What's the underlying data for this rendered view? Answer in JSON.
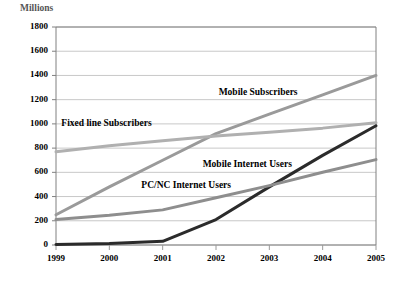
{
  "chart_data": {
    "type": "line",
    "title": "",
    "xlabel": "",
    "ylabel": "Millions",
    "unit_label": "Millions",
    "x": [
      "1999",
      "2000",
      "2001",
      "2002",
      "2003",
      "2004",
      "2005"
    ],
    "categories": [
      "1999",
      "2000",
      "2001",
      "2002",
      "2003",
      "2004",
      "2005"
    ],
    "xlim": [
      1999,
      2005
    ],
    "ylim": [
      0,
      1800
    ],
    "ytick_labels": [
      "0",
      "200",
      "400",
      "600",
      "800",
      "1000",
      "1200",
      "1400",
      "1600",
      "1800"
    ],
    "ytick_values": [
      0,
      200,
      400,
      600,
      800,
      1000,
      1200,
      1400,
      1600,
      1800
    ],
    "grid": true,
    "grid_axis": "y",
    "legend_position": "inline-annotations",
    "series": [
      {
        "name": "Mobile Subscribers",
        "label": "Mobile Subscribers",
        "color": "#9a9a9a",
        "width": 3.0,
        "values": [
          250,
          480,
          700,
          920,
          1080,
          1240,
          1400
        ],
        "label_x": 2002.05,
        "label_y": 1255
      },
      {
        "name": "Fixed line Subscribers",
        "label": "Fixed line Subscribers",
        "color": "#b0b0b0",
        "width": 3.0,
        "values": [
          770,
          820,
          860,
          900,
          930,
          965,
          1010
        ],
        "label_x": 1999.1,
        "label_y": 1000
      },
      {
        "name": "Mobile Internet Users",
        "label": "Mobile Internet Users",
        "color": "#2b2b2b",
        "width": 3.0,
        "values": [
          5,
          12,
          30,
          210,
          480,
          740,
          985
        ],
        "label_x": 2001.75,
        "label_y": 660
      },
      {
        "name": "PC/NC Internet Users",
        "label": "PC/NC Internet Users",
        "color": "#8e8e8e",
        "width": 3.0,
        "values": [
          210,
          245,
          290,
          390,
          490,
          600,
          705
        ],
        "label_x": 2000.6,
        "label_y": 490
      }
    ]
  },
  "axes": {
    "frame_color": "#808080",
    "grid_color": "#c8c8c8",
    "tick_color": "#9a9a9a"
  }
}
